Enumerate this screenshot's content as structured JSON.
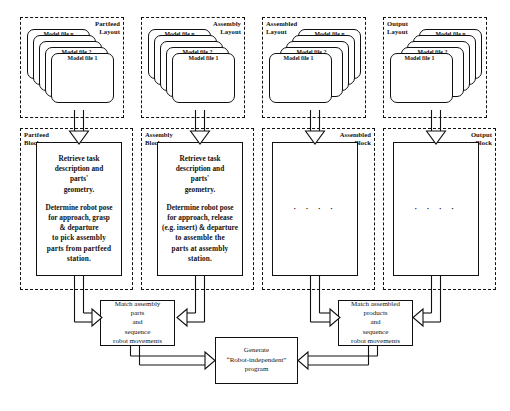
{
  "diagram": {
    "layout_groups": [
      {
        "id": "partfeed-layout",
        "label_line1": "Partfeed",
        "label_line2": "Layout",
        "label_side": "right",
        "cards": [
          "Model file n",
          "Model file 2",
          "Model file 1"
        ]
      },
      {
        "id": "assembly-layout",
        "label_line1": "Assembly",
        "label_side": "right",
        "label_line2": "Layout",
        "cards": [
          "Model file n",
          "Model file 2",
          "Model file 1"
        ]
      },
      {
        "id": "assembled-layout",
        "label_line1": "Assembled",
        "label_line2": "Layout",
        "label_side": "left",
        "cards": [
          "Model file n",
          "Model file 2",
          "Model file 1"
        ]
      },
      {
        "id": "output-layout",
        "label_line1": "Output",
        "label_line2": "Layout",
        "label_side": "left",
        "cards": [
          "Model file n",
          "Model file 2",
          "Model file 1"
        ]
      }
    ],
    "block_groups": [
      {
        "id": "partfeed-block",
        "label_line1": "Partfeed",
        "label_line2": "Block",
        "label_side": "left"
      },
      {
        "id": "assembly-block",
        "label_line1": "Assembly",
        "label_line2": "Block",
        "label_side": "left"
      },
      {
        "id": "assembled-block",
        "label_line1": "Assembled",
        "label_line2": "Block",
        "label_side": "right"
      },
      {
        "id": "output-block",
        "label_line1": "Output",
        "label_line2": "Block",
        "label_side": "right"
      }
    ],
    "process_boxes": {
      "partfeed": {
        "para1_l1": "Retrieve task",
        "para1_l2": "description and",
        "para1_l3": "parts'",
        "para1_l4": "geometry.",
        "para2_l1": "Determine robot pose",
        "para2_l2": "for approach, grasp",
        "para2_l3": "& departure",
        "bold_l1": "to pick assembly",
        "bold_l2": "parts from partfeed",
        "bold_l3": "station."
      },
      "assembly": {
        "para1_l1": "Retrieve task",
        "para1_l2": "description and",
        "para1_l3": "parts'",
        "para1_l4": "geometry.",
        "para2_l1": "Determine robot pose",
        "para2_l2": "for approach, release",
        "para2_l3": "(e.g. insert) & departure",
        "bold_l1": "to assemble the",
        "bold_l2": "parts at assembly",
        "bold_l3": "station."
      },
      "assembled": {
        "content": "· · · ·"
      },
      "output": {
        "content": "· · · ·"
      }
    },
    "match_boxes": [
      {
        "id": "match-assembly-parts",
        "l1": "Match assembly",
        "l2": "parts",
        "l3": "and",
        "l4": "sequence",
        "l5": "robot movements"
      },
      {
        "id": "match-assembled-products",
        "l1": "Match assembled",
        "l2": "products",
        "l3": "and",
        "l4": "sequence",
        "l5": "robot movements"
      }
    ],
    "generate_box": {
      "id": "generate-program",
      "l1": "Generate",
      "l2": "“Robot-independent”",
      "l3": "program"
    },
    "colors": {
      "stroke": "#111111",
      "background": "#ffffff",
      "arrow_fill": "#ffffff"
    }
  }
}
